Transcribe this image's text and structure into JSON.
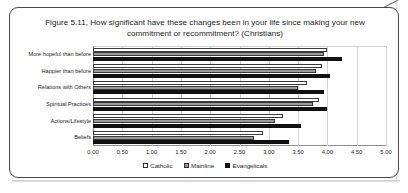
{
  "figure": {
    "title": "Figure 5.11, How significant have these changes been in your life since making your new commitment or recommitment? (Christians)"
  },
  "legend": {
    "items": [
      {
        "label": "Catholic",
        "swatch": "catholic",
        "color": "#ffffff"
      },
      {
        "label": "Mainline",
        "swatch": "mainline",
        "color": "#9a9a9a"
      },
      {
        "label": "Evangelicals",
        "swatch": "evangelicals",
        "color": "#111111"
      }
    ]
  },
  "chart_data": {
    "type": "bar",
    "orientation": "horizontal",
    "title": "Figure 5.11, How significant have these changes been in your life since making your new commitment or recommitment? (Christians)",
    "xlabel": "",
    "ylabel": "",
    "xlim": [
      0.0,
      5.0
    ],
    "xticks": [
      "0.00",
      "0.50",
      "1.00",
      "1.50",
      "2.00",
      "2.50",
      "3.00",
      "3.50",
      "4.00",
      "4.50",
      "5.00"
    ],
    "grid": true,
    "legend_position": "bottom",
    "categories": [
      "More hopeful than before",
      "Happier than before",
      "Relations with Others",
      "Spiritual Practices",
      "Actions/Lifestyle",
      "Beliefs"
    ],
    "series": [
      {
        "name": "Catholic",
        "color": "#ffffff",
        "values": [
          4.0,
          3.9,
          3.65,
          3.85,
          3.25,
          2.9
        ]
      },
      {
        "name": "Mainline",
        "color": "#9a9a9a",
        "values": [
          3.95,
          3.8,
          3.5,
          3.75,
          3.1,
          2.75
        ]
      },
      {
        "name": "Evangelicals",
        "color": "#111111",
        "values": [
          4.25,
          4.05,
          3.95,
          4.0,
          3.55,
          3.35
        ]
      }
    ]
  }
}
